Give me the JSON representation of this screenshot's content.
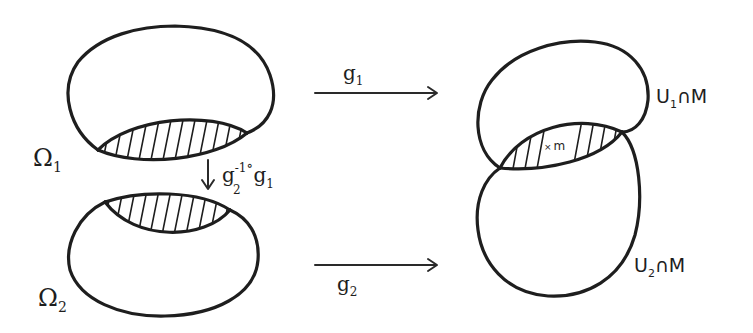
{
  "colors": {
    "ink": "#1e1e1e",
    "background": "#ffffff"
  },
  "left": {
    "omega1": {
      "symbol": "Ω",
      "subscript": "1"
    },
    "omega2": {
      "symbol": "Ω",
      "subscript": "2"
    },
    "transition_map": {
      "text": "g",
      "sub_inverse": "2",
      "sup": "-1",
      "compose": "∘",
      "text2": "g",
      "sub2": "1"
    }
  },
  "arrows": {
    "top": {
      "label": "g",
      "subscript": "1"
    },
    "bottom": {
      "label": "g",
      "subscript": "2"
    }
  },
  "right": {
    "u1": {
      "symbol": "U",
      "subscript": "1",
      "rest": "∩M"
    },
    "u2": {
      "symbol": "U",
      "subscript": "2",
      "rest": "∩M"
    },
    "point": {
      "marker": "×",
      "label": "m"
    }
  }
}
